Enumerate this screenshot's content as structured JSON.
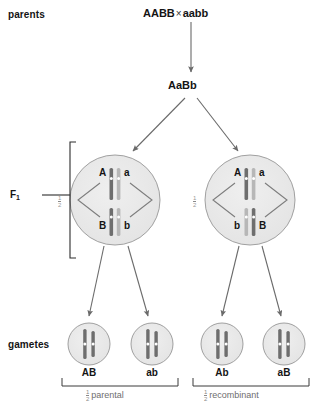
{
  "diagram": {
    "title_text": "Meiosis with crossing over producing parental and recombinant gametes",
    "colors": {
      "cell_fill": "#e8e8e8",
      "cell_stroke": "#9b9b9b",
      "chromosome_dark": "#6b6b6b",
      "chromosome_light": "#b9b9b9",
      "centromere": "#ffffff",
      "arrow": "#6a6a6a",
      "text": "#141414",
      "muted_text": "#7a7a7a"
    }
  },
  "rows": {
    "parents_label": "parents",
    "f1_label": "F",
    "f1_subscript": "1",
    "gametes_label": "gametes"
  },
  "cross": {
    "parent_one": "AABB",
    "operator": "×",
    "parent_two": "aabb",
    "offspring": "AaBb"
  },
  "f1_cells": [
    {
      "name": "f1-cell-left",
      "fraction_numerator": "1",
      "fraction_denominator": "2",
      "top_left_allele": "A",
      "top_right_allele": "a",
      "bottom_left_allele": "B",
      "bottom_right_allele": "b"
    },
    {
      "name": "f1-cell-right",
      "fraction_numerator": "1",
      "fraction_denominator": "2",
      "top_left_allele": "A",
      "top_right_allele": "a",
      "bottom_left_allele": "b",
      "bottom_right_allele": "B"
    }
  ],
  "gametes": [
    {
      "label": "AB",
      "group": "parental"
    },
    {
      "label": "ab",
      "group": "parental"
    },
    {
      "label": "Ab",
      "group": "recombinant"
    },
    {
      "label": "aB",
      "group": "recombinant"
    }
  ],
  "gamete_groups": [
    {
      "name": "parental-group",
      "fraction_numerator": "1",
      "fraction_denominator": "2",
      "text": "parental"
    },
    {
      "name": "recombinant-group",
      "fraction_numerator": "1",
      "fraction_denominator": "2",
      "text": "recombinant"
    }
  ]
}
